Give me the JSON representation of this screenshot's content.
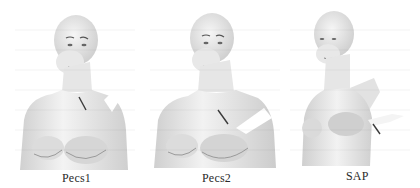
{
  "figure": {
    "panels": [
      {
        "label": "Pecs1",
        "description": "mannequin torso with needle at infraclavicular region and shaded block area near shoulder"
      },
      {
        "label": "Pecs2",
        "description": "mannequin torso with needle below clavicle and shaded block area over lateral chest/shoulder"
      },
      {
        "label": "SAP",
        "description": "mannequin torso with arm raised, needle at lateral chest wall (serratus anterior plane)"
      }
    ]
  },
  "colors": {
    "background": "#ffffff",
    "skin_light": "#f2f2f2",
    "skin_mid": "#d8d8d8",
    "skin_shadow": "#a8a8a8",
    "needle": "#3a3a3a",
    "block_area": "#ffffff",
    "caption_text": "#2a2a2a"
  }
}
